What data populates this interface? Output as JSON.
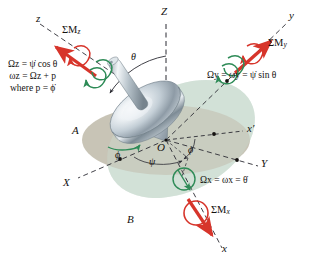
{
  "figure": {
    "background": "#ffffff"
  },
  "colors": {
    "moment_red": "#d7352b",
    "omega_green": "#2e8b57",
    "plane_a": "#c4c0b0",
    "plane_b": "#d6e6dd",
    "axis_line": "#2b2b33",
    "text": "#14110f",
    "rotor_light": "#f2f5f7",
    "rotor_mid": "#b9c3ca",
    "rotor_dark": "#6f7d87"
  },
  "axes": [
    {
      "name": "Z",
      "label": "Z",
      "style": "dashed-vertical"
    },
    {
      "name": "z",
      "label": "z",
      "style": "dashed"
    },
    {
      "name": "y",
      "label": "y",
      "style": "dashed"
    },
    {
      "name": "x",
      "label": "x",
      "style": "dashed"
    },
    {
      "name": "X",
      "label": "X",
      "style": "dashed"
    },
    {
      "name": "Y",
      "label": "Y",
      "style": "dashed"
    },
    {
      "name": "x-prime",
      "label": "x′",
      "style": "dashed"
    }
  ],
  "origin": {
    "label": "O"
  },
  "planes": [
    {
      "id": "A",
      "label": "A",
      "color": "#c4c0b0"
    },
    {
      "id": "B",
      "label": "B",
      "color": "#d6e6dd"
    }
  ],
  "angles": [
    {
      "id": "theta",
      "label": "θ"
    },
    {
      "id": "phi-left",
      "label": "ϕ"
    },
    {
      "id": "phi-right",
      "label": "ϕ"
    },
    {
      "id": "psi",
      "label": "ψ"
    }
  ],
  "moments": [
    {
      "id": "sum-m-z",
      "label": "ΣM",
      "sub": "z",
      "color": "#d7352b"
    },
    {
      "id": "sum-m-y",
      "label": "ΣM",
      "sub": "y",
      "color": "#d7352b"
    },
    {
      "id": "sum-m-x",
      "label": "ΣM",
      "sub": "x",
      "color": "#d7352b"
    }
  ],
  "equations": {
    "z_block": {
      "line1": "Ωz = ψ̇ cos θ",
      "line2": "ωz = Ωz + p",
      "line3": "where p = ϕ̇"
    },
    "y_line": "Ωy = ωy = ψ̇ sin θ",
    "x_line": "Ωx = ωx = θ̇"
  }
}
